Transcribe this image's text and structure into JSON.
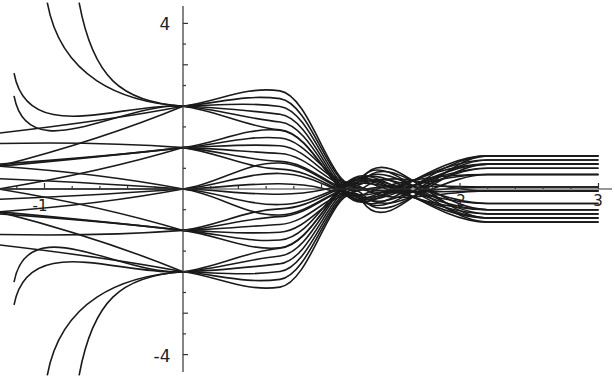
{
  "chart_data": {
    "type": "line",
    "title": "",
    "xlabel": "",
    "ylabel": "",
    "xlim": [
      -1.33,
      3.1
    ],
    "ylim": [
      -4.5,
      4.5
    ],
    "grid": false,
    "legend": null,
    "x_ticks": [
      {
        "value": -1,
        "label": "-1"
      },
      {
        "value": 2,
        "label": "2"
      },
      {
        "value": 3,
        "label": "3"
      }
    ],
    "y_ticks": [
      {
        "value": 4,
        "label": "4"
      },
      {
        "value": -4,
        "label": "-4"
      }
    ],
    "nodes_at_x0": [
      2,
      1,
      0,
      -1,
      -2
    ],
    "left_branches": {
      "from_node_2": {
        "start_y_at_x_minus_1.2": [
          4.5,
          4.5,
          2.8,
          2.3
        ]
      },
      "from_node_minus_2": {
        "start_y_at_x_minus_1.2": [
          -2.3,
          -2.8,
          -4.5,
          -4.5
        ]
      }
    },
    "right_asymptotes_y": [
      0.8,
      0.7,
      0.6,
      0.5,
      0.35,
      0.05,
      -0.05,
      -0.35,
      -0.5,
      -0.6,
      -0.7,
      -0.8
    ],
    "caustic_center": {
      "x": 1.2,
      "y": 0
    }
  }
}
